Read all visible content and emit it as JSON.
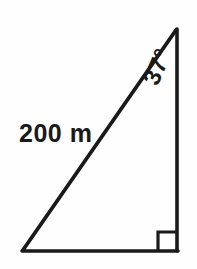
{
  "figure": {
    "type": "right-triangle-diagram",
    "background_color": "#fefefe",
    "stroke_color": "#1a1a1a",
    "stroke_width": 3.6,
    "vertices": {
      "apex_top_right": [
        177,
        28
      ],
      "corner_bottom_right": [
        177,
        251
      ],
      "corner_bottom_left": [
        22,
        251
      ]
    },
    "labels": {
      "hypotenuse": "200 m",
      "angle": "37°"
    },
    "right_angle_marker": {
      "present": true,
      "at_vertex": "corner_bottom_right",
      "size": 19
    }
  }
}
